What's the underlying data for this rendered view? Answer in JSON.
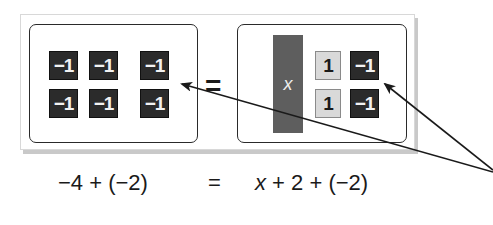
{
  "diagram": {
    "left_mat": {
      "tiles": [
        {
          "label": "−1",
          "type": "negative-unit"
        },
        {
          "label": "−1",
          "type": "negative-unit"
        },
        {
          "label": "−1",
          "type": "negative-unit"
        },
        {
          "label": "−1",
          "type": "negative-unit"
        },
        {
          "label": "−1",
          "type": "negative-unit"
        },
        {
          "label": "−1",
          "type": "negative-unit"
        }
      ]
    },
    "equals_sign": "=",
    "right_mat": {
      "variable_tile": {
        "label": "x",
        "type": "variable"
      },
      "tiles": [
        {
          "label": "1",
          "type": "positive-unit"
        },
        {
          "label": "−1",
          "type": "negative-unit"
        },
        {
          "label": "1",
          "type": "positive-unit"
        },
        {
          "label": "−1",
          "type": "negative-unit"
        }
      ]
    },
    "equation": {
      "left": "−4 + (−2)",
      "equals": "=",
      "right_var": "x",
      "right_rest": " + 2 + (−2)"
    },
    "colors": {
      "negative_tile": "#2b2b2b",
      "positive_tile": "#d9d9d9",
      "variable_tile": "#5e5e5e",
      "mat_border": "#2a2a2a"
    }
  }
}
